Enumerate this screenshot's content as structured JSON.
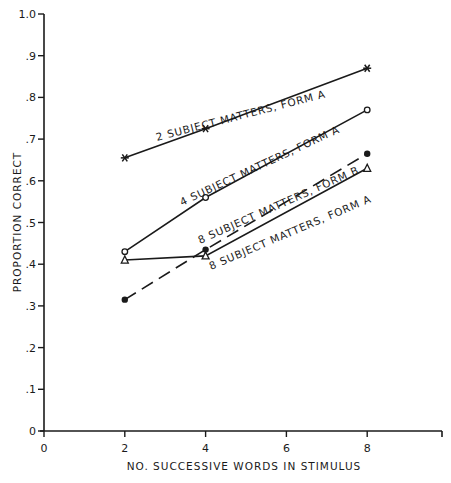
{
  "chart_data": {
    "type": "line",
    "title": "",
    "xlabel": "NO. SUCCESSIVE WORDS IN STIMULUS",
    "ylabel": "PROPORTION CORRECT",
    "xlim": [
      0,
      10
    ],
    "ylim": [
      0,
      1.0
    ],
    "x_ticks": [
      0,
      2,
      4,
      6,
      8
    ],
    "x_tick_labels": [
      "0",
      "2",
      "4",
      "6",
      "8"
    ],
    "y_ticks": [
      0,
      0.1,
      0.2,
      0.3,
      0.4,
      0.5,
      0.6,
      0.7,
      0.8,
      0.9,
      1.0
    ],
    "y_tick_labels": [
      "0",
      ".1",
      ".2",
      ".3",
      ".4",
      ".5",
      ".6",
      ".7",
      ".8",
      ".9",
      "1.0"
    ],
    "grid": false,
    "legend_position": "inline labels along lines",
    "x": [
      2,
      4,
      8
    ],
    "series": [
      {
        "name": "2 SUBJECT MATTERS, FORM A",
        "values": [
          0.655,
          0.725,
          0.87
        ],
        "marker": "asterisk",
        "line": "solid"
      },
      {
        "name": "4 SUBJECT MATTERS, FORM A",
        "values": [
          0.43,
          0.56,
          0.77
        ],
        "marker": "open-circle",
        "line": "solid"
      },
      {
        "name": "8 SUBJECT MATTERS, FORM B",
        "values": [
          0.315,
          0.435,
          0.665
        ],
        "marker": "filled-circle",
        "line": "dashed"
      },
      {
        "name": "8 SUBJECT MATTERS, FORM A",
        "values": [
          0.41,
          0.42,
          0.63
        ],
        "marker": "open-triangle",
        "line": "solid"
      }
    ]
  },
  "labels": {
    "y_axis": "PROPORTION CORRECT",
    "x_axis": "NO. SUCCESSIVE WORDS IN STIMULUS",
    "s1": "2 SUBJECT MATTERS, FORM A",
    "s2": "4 SUBJECT MATTERS, FORM A",
    "s3": "8 SUBJECT MATTERS, FORM B",
    "s4": "8 SUBJECT MATTERS, FORM A"
  },
  "colors": {
    "ink": "#1a1a1a",
    "background": "#ffffff"
  }
}
